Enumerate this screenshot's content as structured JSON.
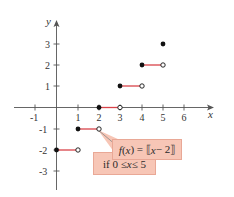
{
  "figure": {
    "type": "step-function graph",
    "function_label": {
      "f": "f",
      "open_paren": "(",
      "var": "x",
      "eq": ") = ⟦",
      "var2": "x",
      "rest": " − 2⟧"
    },
    "domain_label": {
      "prefix": "if 0 ≤ ",
      "var": "x",
      "suffix": " ≤ 5"
    },
    "axes": {
      "x_label": "x",
      "y_label": "y",
      "x_ticks": [
        -1,
        1,
        2,
        3,
        4,
        5,
        6
      ],
      "y_ticks": [
        3,
        2,
        1,
        -1,
        -2,
        -3
      ]
    },
    "colors": {
      "segment": "#d9434a",
      "label_fill": "#f7c6b6",
      "axis": "#555555"
    },
    "segments": [
      {
        "x_start": 0,
        "x_end": 1,
        "y": -2,
        "start": "closed",
        "end": "open"
      },
      {
        "x_start": 1,
        "x_end": 2,
        "y": -1,
        "start": "closed",
        "end": "open"
      },
      {
        "x_start": 2,
        "x_end": 3,
        "y": 0,
        "start": "closed",
        "end": "open"
      },
      {
        "x_start": 3,
        "x_end": 4,
        "y": 1,
        "start": "closed",
        "end": "open"
      },
      {
        "x_start": 4,
        "x_end": 5,
        "y": 2,
        "start": "closed",
        "end": "open"
      }
    ],
    "points": [
      {
        "x": 5,
        "y": 3,
        "type": "closed"
      }
    ]
  }
}
